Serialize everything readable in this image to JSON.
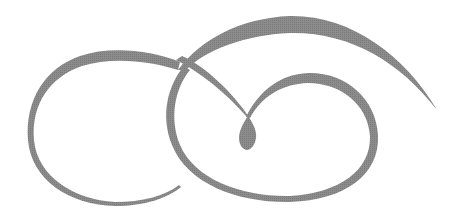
{
  "image": {
    "description": "Decorative calligraphic flourish ornament with interlocking swirls",
    "background": "#ffffff",
    "stroke_color": "#8a8a8a"
  },
  "elements": [
    {
      "name": "left-swirl",
      "description": "Large open C-shaped swirl on left"
    },
    {
      "name": "top-arc",
      "description": "Thick arc sweeping right with tapered end"
    },
    {
      "name": "inner-loop",
      "description": "Loop curling into central teardrop"
    },
    {
      "name": "teardrop",
      "description": "Central teardrop terminal"
    }
  ]
}
